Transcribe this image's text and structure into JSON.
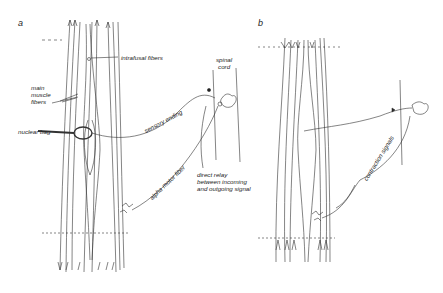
{
  "panels": [
    {
      "id": "a",
      "label": "a",
      "annotations": {
        "intrafusal_fibers": "intrafusal fibers",
        "main_muscle_fibers": [
          "main",
          "muscle",
          "fibers"
        ],
        "nuclear_bag": "nuclear bag",
        "sensory_ending": "sensory ending",
        "spinal_cord": [
          "spinal",
          "cord"
        ],
        "alpha_motor_fiber": "alpha motor fiber",
        "direct_relay": [
          "direct relay",
          "between incoming",
          "and outgoing signal"
        ]
      }
    },
    {
      "id": "b",
      "label": "b",
      "annotations": {
        "contraction_signals": "contraction signals"
      }
    }
  ],
  "colors": {
    "ink": "#333333",
    "background": "#ffffff"
  }
}
